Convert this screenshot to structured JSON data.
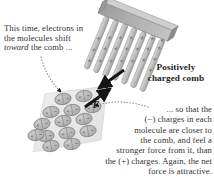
{
  "figure": {
    "background_color": "#ffffff"
  },
  "captions": {
    "top_left": {
      "line1": "This time, electrons in",
      "line2": "the molecules shift",
      "line3_italic": "toward",
      "line3_rest": " the comb ..."
    },
    "comb_label": {
      "line1": "Positively",
      "line2": "charged comb"
    },
    "bottom_right": {
      "line1": "... so that the",
      "line2": "(−) charges in each",
      "line3": "molecule are closer to",
      "line4": "the comb, and feel a",
      "line5": "stronger force from it, than",
      "line6": "the (+) charges. Again, the net",
      "line7": "force is attractive."
    }
  },
  "vectors": {
    "force_on_slab": {
      "label": "F",
      "symbol_prefix": ""
    },
    "force_on_comb": {
      "label": "F",
      "symbol_prefix": "−"
    }
  },
  "comb": {
    "charge_symbol": "+",
    "charge_count": 24,
    "tooth_count": 8,
    "body_color": "#9a9a9a",
    "tooth_color": "#c9c9c9",
    "charge_color": "#3c3c3c"
  },
  "slab": {
    "fill_color": "#e8e8e8",
    "molecule_count": 15,
    "molecule_rows": 5,
    "molecule_cols": 3,
    "molecule_fill": "#b6b6b6",
    "molecule_positive_symbol": "+",
    "molecule_negative_symbol": "−"
  },
  "leaders": {
    "top_left_leader_color": "#8d8d8d",
    "bottom_right_leader_color": "#8d8d8d",
    "style": "dotted"
  },
  "colors": {
    "arrow": "#141414",
    "text": "#333333",
    "label_bold": "#1d1d1d"
  }
}
